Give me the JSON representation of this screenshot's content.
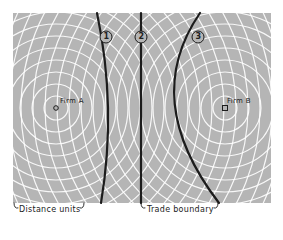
{
  "diagram": {
    "background_color": "#b5b5b5",
    "ring_color": "#ffffff",
    "boundary_color": "#1c1c1c",
    "firms": [
      {
        "label": "Firm A",
        "x": 56,
        "y": 108,
        "marker": "circle"
      },
      {
        "label": "Firm B",
        "x": 225,
        "y": 108,
        "marker": "square"
      }
    ],
    "boundaries": [
      {
        "number": "1",
        "label_glyph": "①"
      },
      {
        "number": "2",
        "label_glyph": "②"
      },
      {
        "number": "3",
        "label_glyph": "③"
      }
    ],
    "legend": {
      "distance_units": "Distance units",
      "trade_boundary": "Trade boundary"
    }
  }
}
